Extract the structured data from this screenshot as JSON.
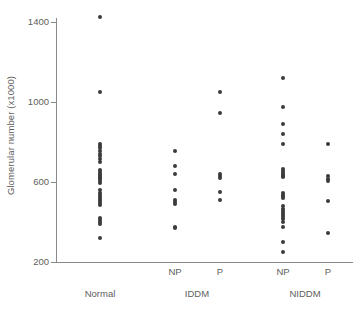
{
  "chart_data": {
    "type": "scatter",
    "title": "",
    "subtitle": "",
    "xlabel": "",
    "ylabel": "Glomerular number (x1000)",
    "ylim": [
      200,
      1400
    ],
    "yticks": [
      200,
      600,
      1000,
      1400
    ],
    "ytick_labels": [
      "200",
      "600",
      "1000",
      "1400"
    ],
    "grid": false,
    "legend": "none",
    "point_color": "#3b3b3b",
    "axis_color": "#8a8a8a",
    "text_color": "#5e5e5e",
    "x_categories": [
      "Normal",
      "IDDM",
      "NIDDM"
    ],
    "x_subcategories": [
      "",
      "NP",
      "P",
      "NP",
      "P"
    ],
    "series": [
      {
        "name": "Normal",
        "group": "Normal",
        "subgroup": "",
        "x_position": 1,
        "n": 32,
        "values": [
          1425,
          1050,
          790,
          780,
          770,
          755,
          740,
          730,
          715,
          700,
          660,
          650,
          640,
          635,
          625,
          620,
          615,
          605,
          595,
          560,
          545,
          535,
          525,
          515,
          505,
          495,
          485,
          420,
          410,
          400,
          390,
          320
        ]
      },
      {
        "name": "IDDM NP",
        "group": "IDDM",
        "subgroup": "NP",
        "x_position": 2,
        "n": 9,
        "values": [
          755,
          680,
          640,
          560,
          510,
          500,
          490,
          375,
          370
        ]
      },
      {
        "name": "IDDM P",
        "group": "IDDM",
        "subgroup": "P",
        "x_position": 3,
        "n": 6,
        "values": [
          1050,
          945,
          640,
          630,
          620,
          550,
          510
        ]
      },
      {
        "name": "NIDDM NP",
        "group": "NIDDM",
        "subgroup": "NP",
        "x_position": 4,
        "n": 28,
        "values": [
          1120,
          975,
          890,
          840,
          790,
          665,
          655,
          645,
          635,
          630,
          625,
          545,
          535,
          530,
          520,
          480,
          465,
          455,
          445,
          435,
          425,
          415,
          400,
          375,
          300,
          250
        ]
      },
      {
        "name": "NIDDM P",
        "group": "NIDDM",
        "subgroup": "P",
        "x_position": 5,
        "n": 7,
        "values": [
          790,
          630,
          615,
          605,
          505,
          345
        ]
      }
    ]
  },
  "axis": {
    "y_title": "Glomerular number (x1000)"
  },
  "x_axis": {
    "subgroups": [
      {
        "label": "NP",
        "center": 175
      },
      {
        "label": "P",
        "center": 220
      },
      {
        "label": "NP",
        "center": 283
      },
      {
        "label": "P",
        "center": 328
      }
    ],
    "groups": [
      {
        "label": "Normal",
        "center": 100
      },
      {
        "label": "IDDM",
        "center": 197
      },
      {
        "label": "NIDDM",
        "center": 305
      }
    ]
  }
}
